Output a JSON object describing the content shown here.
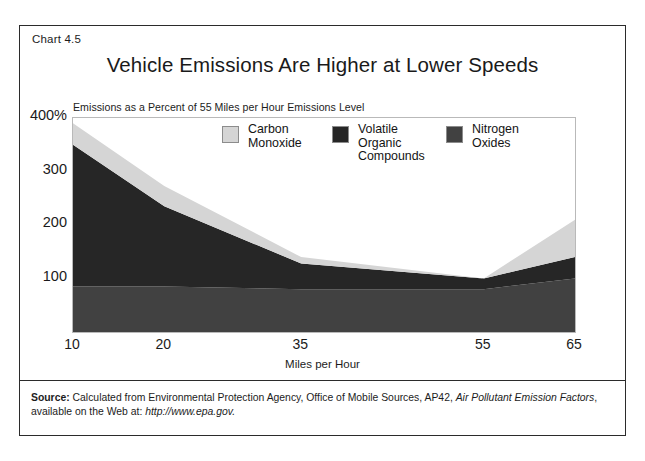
{
  "figure": {
    "chart_number": "Chart 4.5",
    "title": "Vehicle Emissions Are Higher at Lower Speeds",
    "subtitle": "Emissions as a Percent of 55 Miles per Hour Emissions Level"
  },
  "source": {
    "label": "Source:",
    "text_part1": " Calculated from Environmental Protection Agency, Office of Mobile Sources, AP42, ",
    "italic1": "Air Pollutant Emission Factors",
    "text_part2": ", available on the Web at: ",
    "italic2": "http://www.epa.gov."
  },
  "legend": {
    "items": [
      {
        "label": "Carbon\nMonoxide",
        "color": "#d5d5d5"
      },
      {
        "label": "Volatile\nOrganic\nCompounds",
        "color": "#262626"
      },
      {
        "label": "Nitrogen\nOxides",
        "color": "#414141"
      }
    ]
  },
  "axes": {
    "y_ticks": [
      "400%",
      "300",
      "200",
      "100"
    ],
    "x_ticks": [
      "10",
      "20",
      "35",
      "55",
      "65"
    ],
    "x_title": "Miles per Hour"
  },
  "chart_data": {
    "type": "area",
    "stacked": true,
    "title": "Vehicle Emissions Are Higher at Lower Speeds",
    "subtitle": "Emissions as a Percent of 55 Miles per Hour Emissions Level",
    "xlabel": "Miles per Hour",
    "ylabel": "Emissions as a Percent of 55 Miles per Hour Emissions Level",
    "x": [
      10,
      20,
      35,
      55,
      65
    ],
    "xlim": [
      10,
      65
    ],
    "ylim": [
      0,
      400
    ],
    "yticks": [
      100,
      200,
      300,
      400
    ],
    "ytick_labels": [
      "100",
      "200",
      "300",
      "400%"
    ],
    "grid": false,
    "legend_position": "top-center-inside",
    "series": [
      {
        "name": "Nitrogen Oxides",
        "color": "#414141",
        "values": [
          85,
          85,
          80,
          80,
          100
        ]
      },
      {
        "name": "Volatile Organic Compounds",
        "color": "#262626",
        "values": [
          265,
          150,
          48,
          20,
          40
        ]
      },
      {
        "name": "Carbon Monoxide",
        "color": "#d5d5d5",
        "values": [
          40,
          38,
          12,
          0,
          70
        ]
      }
    ],
    "cumulative_tops": {
      "Nitrogen Oxides": [
        85,
        85,
        80,
        80,
        100
      ],
      "Volatile Organic Compounds": [
        350,
        235,
        128,
        100,
        140
      ],
      "Carbon Monoxide": [
        390,
        273,
        140,
        100,
        210
      ]
    }
  }
}
